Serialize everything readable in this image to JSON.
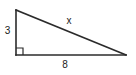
{
  "figure": {
    "name": "right-triangle",
    "background_color": "#ffffff",
    "stroke_color": "#2b2b2b",
    "text_color": "#1a1a1a"
  },
  "labels": {
    "vertical_leg": "3",
    "hypotenuse": "x",
    "horizontal_leg": "8"
  },
  "geometry": {
    "top_left_vertex": "16,10",
    "bottom_left_vertex": "16,55",
    "bottom_right_vertex": "126,55",
    "right_angle_marker_size": "7"
  }
}
